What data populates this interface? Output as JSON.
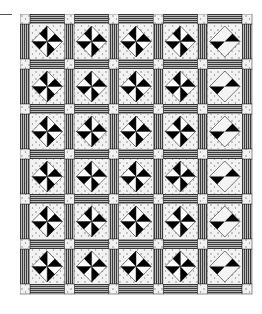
{
  "figure": {
    "layout": {
      "columns": 5,
      "rows": 6
    },
    "block_style": "pinwheel-in-diamond",
    "last_column_style": "partial-pinwheel",
    "colors": {
      "background": "#ffffff",
      "sashing_dark": "#4a4a4a",
      "sashing_light": "#bdbdbd",
      "print_bg": "#f2f2f2",
      "print_dot": "#8a8a8a",
      "pinwheel_dark": "#000000",
      "pinwheel_light": "#ffffff",
      "cornerstone": "#eeeeee",
      "outline": "#222222"
    },
    "dimensions": {
      "sash": 10,
      "block_w": 34.4,
      "block_h": 35
    }
  }
}
